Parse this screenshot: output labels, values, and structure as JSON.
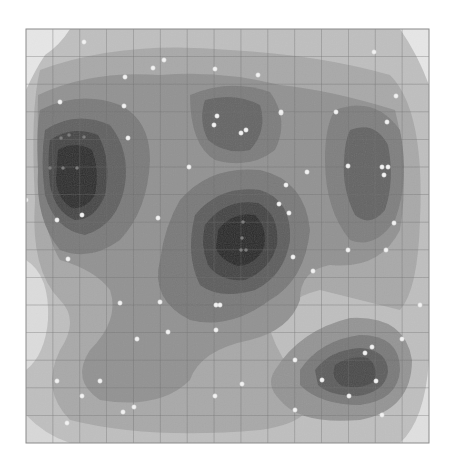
{
  "chart_data": {
    "type": "heatmap",
    "subtype": "filled-contour-density-with-scatter",
    "title": "",
    "xlabel": "",
    "ylabel": "",
    "grid": true,
    "legend": null,
    "plot_area_px": {
      "x0": 26,
      "y0": 29,
      "x1": 429,
      "y1": 443
    },
    "grid_divisions": {
      "cols": 15,
      "rows": 15
    },
    "colormap": [
      "#d9d9d9",
      "#bdbdbd",
      "#a5a5a5",
      "#8e8e8e",
      "#777777",
      "#5f5f5f",
      "#454545",
      "#2a2a2a"
    ],
    "background_level_color": "#c9c9c9",
    "density_peaks": [
      {
        "name": "upper-left",
        "cx": 70,
        "cy": 150,
        "rx": 48,
        "ry": 80,
        "level": 7
      },
      {
        "name": "upper-center",
        "cx": 237,
        "cy": 125,
        "rx": 40,
        "ry": 45,
        "level": 5
      },
      {
        "name": "center",
        "cx": 245,
        "cy": 240,
        "rx": 55,
        "ry": 70,
        "level": 7
      },
      {
        "name": "right",
        "cx": 370,
        "cy": 165,
        "rx": 32,
        "ry": 60,
        "level": 5
      },
      {
        "name": "lower-right",
        "cx": 355,
        "cy": 370,
        "rx": 55,
        "ry": 40,
        "level": 6
      }
    ],
    "points_bright": [
      [
        84,
        42
      ],
      [
        164,
        60
      ],
      [
        153,
        68
      ],
      [
        125,
        77
      ],
      [
        60,
        102
      ],
      [
        124,
        106
      ],
      [
        215,
        69
      ],
      [
        258,
        75
      ],
      [
        374,
        52
      ],
      [
        396,
        96
      ],
      [
        281,
        113
      ],
      [
        336,
        112
      ],
      [
        387,
        122
      ],
      [
        281,
        112
      ],
      [
        217,
        116
      ],
      [
        214,
        125
      ],
      [
        246,
        130
      ],
      [
        241,
        133
      ],
      [
        307,
        172
      ],
      [
        128,
        138
      ],
      [
        189,
        167
      ],
      [
        348,
        166
      ],
      [
        382,
        167
      ],
      [
        388,
        167
      ],
      [
        384,
        175
      ],
      [
        286,
        185
      ],
      [
        279,
        204
      ],
      [
        289,
        213
      ],
      [
        82,
        215
      ],
      [
        57,
        220
      ],
      [
        26,
        200
      ],
      [
        158,
        218
      ],
      [
        394,
        223
      ],
      [
        293,
        257
      ],
      [
        313,
        271
      ],
      [
        68,
        259
      ],
      [
        348,
        250
      ],
      [
        386,
        250
      ],
      [
        120,
        303
      ],
      [
        160,
        302
      ],
      [
        216,
        305
      ],
      [
        220,
        305
      ],
      [
        216,
        330
      ],
      [
        168,
        332
      ],
      [
        137,
        339
      ],
      [
        420,
        305
      ],
      [
        402,
        339
      ],
      [
        372,
        347
      ],
      [
        365,
        353
      ],
      [
        57,
        381
      ],
      [
        295,
        360
      ],
      [
        322,
        380
      ],
      [
        376,
        381
      ],
      [
        349,
        396
      ],
      [
        82,
        396
      ],
      [
        295,
        410
      ],
      [
        242,
        384
      ],
      [
        215,
        396
      ],
      [
        134,
        407
      ],
      [
        123,
        412
      ],
      [
        67,
        423
      ],
      [
        382,
        415
      ],
      [
        100,
        381
      ]
    ],
    "points_dim": [
      [
        61,
        138
      ],
      [
        69,
        135
      ],
      [
        84,
        137
      ],
      [
        50,
        168
      ],
      [
        63,
        168
      ],
      [
        77,
        168
      ],
      [
        243,
        222
      ],
      [
        242,
        238
      ],
      [
        241,
        250
      ],
      [
        246,
        250
      ]
    ]
  }
}
